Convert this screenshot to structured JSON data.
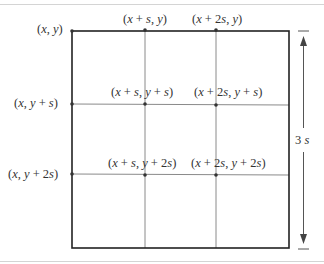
{
  "diagram": {
    "type": "grid-subdivision",
    "rows": 3,
    "cols": 3,
    "dimension_label": "3 s",
    "corner_labels": {
      "top_left": "(x, y)",
      "top_1": "(x + s, y)",
      "top_2": "(x + 2s, y)",
      "left_1": "(x, y  + s)",
      "left_2": "(x, y  + 2s)",
      "inner_11": "(x + s, y  + s)",
      "inner_12": "(x + 2s, y  + s)",
      "inner_21": "(x  + s, y  + 2s)",
      "inner_22": "(x  + 2s, y  + 2s)"
    },
    "colors": {
      "outer_border": "#222222",
      "grid_lines": "#8a8a8a",
      "text": "#333333",
      "arrow": "#555555"
    }
  }
}
